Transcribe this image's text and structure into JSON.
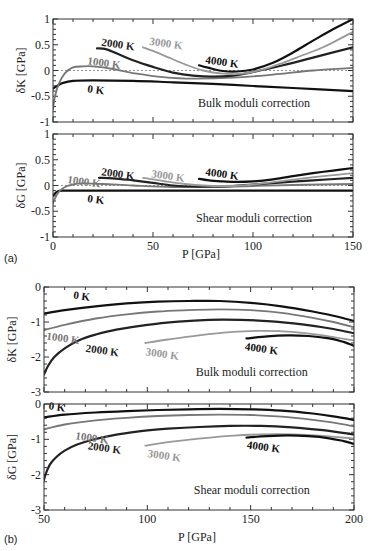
{
  "figure": {
    "panel_a_tag": "(a)",
    "panel_b_tag": "(b)",
    "xlabel": "P [GPa]"
  },
  "colors": {
    "0 K": "#111111",
    "1000 K": "#777777",
    "2000 K": "#222222",
    "3000 K": "#999999",
    "4000 K": "#111111"
  },
  "chart_data": [
    {
      "id": "a-bulk",
      "type": "line",
      "title": "",
      "annotation": "Bulk moduli correction",
      "xlabel": "",
      "ylabel": "δK [GPa]",
      "xlim": [
        0,
        150
      ],
      "ylim": [
        -1,
        1
      ],
      "yticks": [
        "1",
        "0.5",
        "0",
        "-0.5",
        "-1"
      ],
      "xticks": [],
      "zero_line": true,
      "frame": {
        "x0": 53,
        "x1": 353,
        "y0": 19,
        "y1": 122
      },
      "series": [
        {
          "name": "0 K",
          "x": [
            0,
            2,
            5,
            10,
            20,
            40,
            60,
            80,
            100,
            120,
            150
          ],
          "y": [
            -0.35,
            -0.3,
            -0.24,
            -0.2,
            -0.19,
            -0.2,
            -0.23,
            -0.26,
            -0.3,
            -0.34,
            -0.4
          ],
          "width": 2.2
        },
        {
          "name": "1000 K",
          "x": [
            0,
            1,
            3,
            6,
            10,
            15,
            20,
            30,
            40,
            55,
            70,
            90,
            110,
            130,
            150
          ],
          "y": [
            -0.75,
            -0.5,
            -0.25,
            -0.05,
            0.06,
            0.08,
            0.08,
            0.03,
            -0.05,
            -0.13,
            -0.16,
            -0.14,
            -0.08,
            0.0,
            0.05
          ],
          "width": 1.8
        },
        {
          "name": "2000 K",
          "x": [
            22,
            26,
            32,
            40,
            50,
            60,
            70,
            80,
            90,
            100,
            115,
            130,
            150
          ],
          "y": [
            0.43,
            0.42,
            0.33,
            0.2,
            0.07,
            -0.04,
            -0.1,
            -0.12,
            -0.1,
            -0.03,
            0.1,
            0.25,
            0.45
          ],
          "width": 2.2
        },
        {
          "name": "3000 K",
          "x": [
            45,
            50,
            58,
            66,
            75,
            85,
            95,
            105,
            115,
            125,
            135,
            150
          ],
          "y": [
            0.45,
            0.38,
            0.25,
            0.12,
            0.0,
            -0.06,
            -0.06,
            0.02,
            0.15,
            0.3,
            0.45,
            0.75
          ],
          "width": 1.8
        },
        {
          "name": "4000 K",
          "x": [
            73,
            78,
            85,
            92,
            100,
            110,
            120,
            130,
            140,
            150
          ],
          "y": [
            0.1,
            0.05,
            -0.01,
            -0.02,
            0.02,
            0.15,
            0.35,
            0.58,
            0.8,
            1.0
          ],
          "width": 2.2
        }
      ],
      "labels": [
        {
          "text": "0 K",
          "x": 17,
          "y": -0.42,
          "color": "#111111"
        },
        {
          "text": "1000 K",
          "x": 17,
          "y": 0.12,
          "color": "#777777"
        },
        {
          "text": "2000 K",
          "x": 24,
          "y": 0.48,
          "color": "#222222"
        },
        {
          "text": "3000 K",
          "x": 48,
          "y": 0.5,
          "color": "#999999"
        },
        {
          "text": "4000 K",
          "x": 76,
          "y": 0.14,
          "color": "#111111"
        }
      ]
    },
    {
      "id": "a-shear",
      "type": "line",
      "title": "",
      "annotation": "Shear moduli correction",
      "xlabel": "P [GPa]",
      "ylabel": "δG [GPa]",
      "xlim": [
        0,
        150
      ],
      "ylim": [
        -1,
        1
      ],
      "yticks": [
        "1",
        "0.5",
        "0",
        "-0.5",
        "-1"
      ],
      "xticks": [
        "0",
        "50",
        "100",
        "150"
      ],
      "zero_line": true,
      "frame": {
        "x0": 53,
        "x1": 353,
        "y0": 134,
        "y1": 237
      },
      "series": [
        {
          "name": "0 K",
          "x": [
            0,
            2,
            5,
            10,
            20,
            40,
            60,
            80,
            100,
            120,
            150
          ],
          "y": [
            -0.2,
            -0.12,
            -0.1,
            -0.1,
            -0.1,
            -0.1,
            -0.1,
            -0.1,
            -0.1,
            -0.1,
            -0.1
          ],
          "width": 2.2
        },
        {
          "name": "1000 K",
          "x": [
            0,
            1,
            3,
            6,
            10,
            15,
            25,
            40,
            60,
            80,
            100,
            120,
            150
          ],
          "y": [
            -0.35,
            -0.25,
            -0.12,
            -0.03,
            0.02,
            0.04,
            0.03,
            0.0,
            -0.03,
            -0.03,
            -0.01,
            0.01,
            0.03
          ],
          "width": 1.8
        },
        {
          "name": "2000 K",
          "x": [
            23,
            30,
            40,
            50,
            60,
            70,
            80,
            90,
            100,
            115,
            130,
            150
          ],
          "y": [
            0.15,
            0.14,
            0.1,
            0.05,
            0.0,
            -0.02,
            -0.02,
            -0.01,
            0.02,
            0.06,
            0.1,
            0.15
          ],
          "width": 2.2
        },
        {
          "name": "3000 K",
          "x": [
            45,
            50,
            58,
            66,
            75,
            85,
            95,
            105,
            115,
            125,
            135,
            150
          ],
          "y": [
            0.15,
            0.12,
            0.07,
            0.03,
            0.0,
            -0.01,
            0.0,
            0.04,
            0.09,
            0.14,
            0.18,
            0.24
          ],
          "width": 1.8
        },
        {
          "name": "4000 K",
          "x": [
            73,
            78,
            85,
            92,
            100,
            110,
            120,
            130,
            140,
            150
          ],
          "y": [
            0.13,
            0.1,
            0.08,
            0.07,
            0.08,
            0.12,
            0.18,
            0.24,
            0.29,
            0.34
          ],
          "width": 2.2
        }
      ],
      "labels": [
        {
          "text": "0 K",
          "x": 17,
          "y": -0.32,
          "color": "#111111"
        },
        {
          "text": "1000 K",
          "x": 7,
          "y": 0.05,
          "color": "#777777"
        },
        {
          "text": "2000 K",
          "x": 24,
          "y": 0.2,
          "color": "#222222"
        },
        {
          "text": "3000 K",
          "x": 49,
          "y": 0.16,
          "color": "#999999"
        },
        {
          "text": "4000 K",
          "x": 76,
          "y": 0.2,
          "color": "#111111"
        }
      ]
    },
    {
      "id": "b-bulk",
      "type": "line",
      "title": "",
      "annotation": "Bulk moduli correction",
      "xlabel": "",
      "ylabel": "δK [GPa]",
      "xlim": [
        50,
        200
      ],
      "ylim": [
        -3,
        0
      ],
      "yticks": [
        "0",
        "-1",
        "-2",
        "-3"
      ],
      "xticks": [],
      "zero_line": false,
      "frame": {
        "x0": 44,
        "x1": 354,
        "y0": 287,
        "y1": 392
      },
      "series": [
        {
          "name": "0 K",
          "x": [
            50,
            60,
            75,
            90,
            105,
            120,
            135,
            150,
            165,
            180,
            190,
            200
          ],
          "y": [
            -0.76,
            -0.66,
            -0.55,
            -0.47,
            -0.42,
            -0.4,
            -0.4,
            -0.45,
            -0.55,
            -0.7,
            -0.82,
            -0.97
          ],
          "width": 2.2
        },
        {
          "name": "1000 K",
          "x": [
            50,
            60,
            75,
            90,
            105,
            120,
            135,
            150,
            165,
            180,
            190,
            200
          ],
          "y": [
            -1.23,
            -1.08,
            -0.9,
            -0.78,
            -0.7,
            -0.66,
            -0.64,
            -0.66,
            -0.74,
            -0.88,
            -1.0,
            -1.15
          ],
          "width": 1.8
        },
        {
          "name": "2000 K",
          "x": [
            50,
            52,
            55,
            60,
            67,
            75,
            85,
            100,
            115,
            130,
            145,
            160,
            175,
            190,
            200
          ],
          "y": [
            -2.5,
            -2.25,
            -2.0,
            -1.75,
            -1.52,
            -1.36,
            -1.22,
            -1.08,
            -0.99,
            -0.94,
            -0.94,
            -0.98,
            -1.07,
            -1.2,
            -1.32
          ],
          "width": 2.2
        },
        {
          "name": "3000 K",
          "x": [
            99,
            110,
            125,
            140,
            155,
            170,
            185,
            200
          ],
          "y": [
            -1.6,
            -1.5,
            -1.38,
            -1.29,
            -1.25,
            -1.28,
            -1.38,
            -1.53
          ],
          "width": 1.8
        },
        {
          "name": "4000 K",
          "x": [
            148,
            158,
            168,
            178,
            188,
            195,
            200
          ],
          "y": [
            -1.47,
            -1.41,
            -1.38,
            -1.4,
            -1.47,
            -1.57,
            -1.68
          ],
          "width": 2.2
        }
      ],
      "labels": [
        {
          "text": "0 K",
          "x": 64,
          "y": -0.33,
          "color": "#111111"
        },
        {
          "text": "1000 K",
          "x": 51,
          "y": -1.5,
          "color": "#777777"
        },
        {
          "text": "2000 K",
          "x": 70,
          "y": -1.85,
          "color": "#222222"
        },
        {
          "text": "3000 K",
          "x": 99,
          "y": -1.95,
          "color": "#999999"
        },
        {
          "text": "4000 K",
          "x": 147,
          "y": -1.8,
          "color": "#111111"
        }
      ]
    },
    {
      "id": "b-shear",
      "type": "line",
      "title": "",
      "annotation": "Shear moduli correction",
      "xlabel": "P [GPa]",
      "ylabel": "δG [GPa]",
      "xlim": [
        50,
        200
      ],
      "ylim": [
        -3,
        0
      ],
      "yticks": [
        "0",
        "-1",
        "-2",
        "-3"
      ],
      "xticks": [
        "50",
        "100",
        "150",
        "200"
      ],
      "zero_line": false,
      "frame": {
        "x0": 44,
        "x1": 354,
        "y0": 404,
        "y1": 510
      },
      "series": [
        {
          "name": "0 K",
          "x": [
            50,
            60,
            75,
            90,
            105,
            120,
            135,
            150,
            165,
            180,
            190,
            200
          ],
          "y": [
            -0.38,
            -0.3,
            -0.24,
            -0.2,
            -0.17,
            -0.15,
            -0.14,
            -0.15,
            -0.19,
            -0.27,
            -0.35,
            -0.45
          ],
          "width": 2.2
        },
        {
          "name": "1000 K",
          "x": [
            50,
            60,
            75,
            90,
            105,
            120,
            135,
            150,
            165,
            180,
            190,
            200
          ],
          "y": [
            -0.72,
            -0.58,
            -0.46,
            -0.39,
            -0.34,
            -0.31,
            -0.3,
            -0.31,
            -0.36,
            -0.45,
            -0.53,
            -0.63
          ],
          "width": 1.8
        },
        {
          "name": "2000 K",
          "x": [
            50,
            51,
            53,
            56,
            60,
            66,
            73,
            82,
            95,
            110,
            125,
            140,
            155,
            170,
            185,
            200
          ],
          "y": [
            -2.15,
            -1.95,
            -1.7,
            -1.5,
            -1.32,
            -1.15,
            -1.02,
            -0.9,
            -0.78,
            -0.7,
            -0.65,
            -0.62,
            -0.62,
            -0.66,
            -0.74,
            -0.86
          ],
          "width": 2.2
        },
        {
          "name": "3000 K",
          "x": [
            99,
            110,
            125,
            140,
            155,
            170,
            185,
            200
          ],
          "y": [
            -1.18,
            -1.08,
            -0.98,
            -0.9,
            -0.86,
            -0.86,
            -0.9,
            -0.98
          ],
          "width": 1.8
        },
        {
          "name": "4000 K",
          "x": [
            148,
            158,
            168,
            178,
            188,
            195,
            200
          ],
          "y": [
            -0.95,
            -0.91,
            -0.89,
            -0.91,
            -0.97,
            -1.05,
            -1.13
          ],
          "width": 2.2
        }
      ],
      "labels": [
        {
          "text": "0 K",
          "x": 52,
          "y": -0.15,
          "color": "#111111"
        },
        {
          "text": "1000 K",
          "x": 65,
          "y": -1.0,
          "color": "#777777"
        },
        {
          "text": "2000 K",
          "x": 71,
          "y": -1.28,
          "color": "#222222"
        },
        {
          "text": "3000 K",
          "x": 100,
          "y": -1.5,
          "color": "#999999"
        },
        {
          "text": "4000 K",
          "x": 148,
          "y": -1.25,
          "color": "#111111"
        }
      ]
    }
  ]
}
